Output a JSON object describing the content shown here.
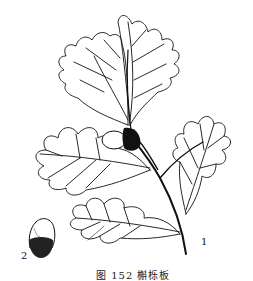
{
  "figure": {
    "labels": [
      {
        "id": "1",
        "text": "1",
        "refers_to": "branch with leaves and acorn"
      },
      {
        "id": "2",
        "text": "2",
        "refers_to": "acorn"
      }
    ],
    "caption": "图 152  槲栎板"
  },
  "colors": {
    "ink": "#111111",
    "paper": "#ffffff"
  }
}
